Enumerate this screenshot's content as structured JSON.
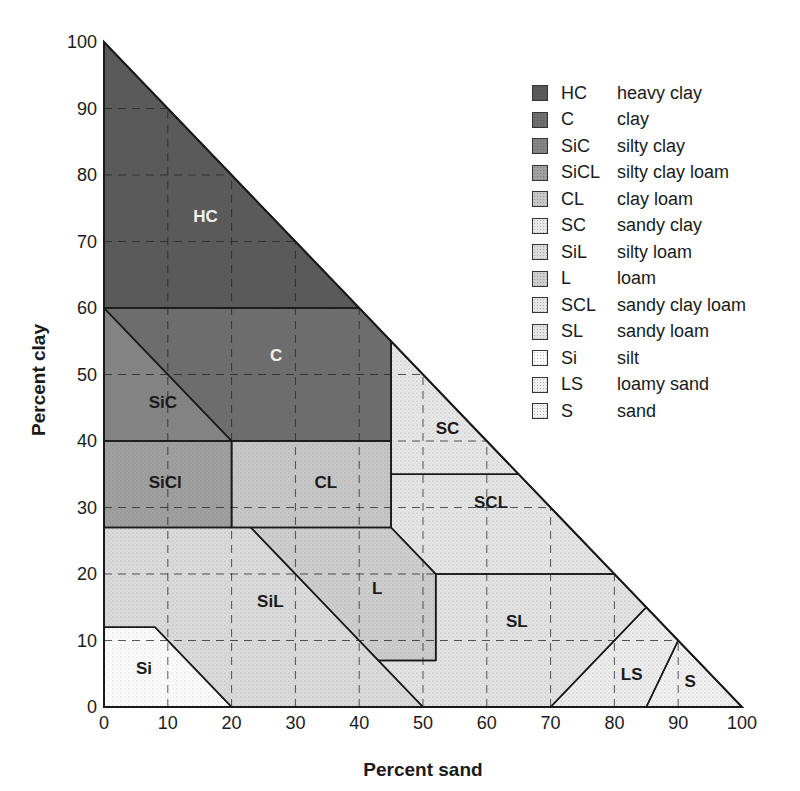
{
  "chart_data": {
    "type": "ternary-soil-texture",
    "title": "",
    "xlabel": "Percent sand",
    "ylabel": "Percent clay",
    "xlim": [
      0,
      100
    ],
    "ylim": [
      0,
      100
    ],
    "x_ticks": [
      "0",
      "10",
      "20",
      "30",
      "40",
      "50",
      "60",
      "70",
      "80",
      "90",
      "100"
    ],
    "y_ticks": [
      "0",
      "10",
      "20",
      "30",
      "40",
      "50",
      "60",
      "70",
      "80",
      "90",
      "100"
    ],
    "grid": "dashed at every 10",
    "legend_position": "upper right",
    "regions": [
      {
        "abbr": "HC",
        "name": "heavy clay",
        "label": "HC",
        "fill": "#5a5a5a",
        "polygon": [
          [
            0,
            60
          ],
          [
            0,
            100
          ],
          [
            40,
            60
          ]
        ],
        "label_at": [
          14,
          73
        ]
      },
      {
        "abbr": "C",
        "name": "clay",
        "label": "C",
        "fill": "#6e6e6e",
        "polygon": [
          [
            0,
            60
          ],
          [
            40,
            60
          ],
          [
            45,
            55
          ],
          [
            45,
            40
          ],
          [
            20,
            40
          ]
        ],
        "label_at": [
          26,
          52
        ]
      },
      {
        "abbr": "SiC",
        "name": "silty clay",
        "label": "SiC",
        "fill": "#858585",
        "polygon": [
          [
            0,
            60
          ],
          [
            20,
            40
          ],
          [
            0,
            40
          ]
        ],
        "label_at": [
          7,
          45
        ]
      },
      {
        "abbr": "SiCL",
        "name": "silty clay loam",
        "label": "SiCl",
        "fill": "#a0a0a0",
        "polygon": [
          [
            0,
            40
          ],
          [
            20,
            40
          ],
          [
            20,
            27
          ],
          [
            0,
            27
          ]
        ],
        "label_at": [
          7,
          33
        ]
      },
      {
        "abbr": "CL",
        "name": "clay loam",
        "label": "CL",
        "fill": "#c8c8c8",
        "polygon": [
          [
            20,
            40
          ],
          [
            45,
            40
          ],
          [
            45,
            27
          ],
          [
            20,
            27
          ]
        ],
        "label_at": [
          33,
          33
        ]
      },
      {
        "abbr": "SC",
        "name": "sandy clay",
        "label": "SC",
        "fill": "#e8e8e8",
        "polygon": [
          [
            45,
            55
          ],
          [
            65,
            35
          ],
          [
            45,
            35
          ]
        ],
        "label_at": [
          52,
          41
        ]
      },
      {
        "abbr": "SiL",
        "name": "silty loam",
        "label": "SiL",
        "fill": "#dcdcdc",
        "polygon": [
          [
            0,
            27
          ],
          [
            23,
            27
          ],
          [
            50,
            0
          ],
          [
            20,
            0
          ],
          [
            8,
            12
          ],
          [
            0,
            12
          ]
        ],
        "label_at": [
          24,
          15
        ]
      },
      {
        "abbr": "L",
        "name": "loam",
        "label": "L",
        "fill": "#cfcfcf",
        "polygon": [
          [
            23,
            27
          ],
          [
            45,
            27
          ],
          [
            52,
            20
          ],
          [
            52,
            7
          ],
          [
            43,
            7
          ]
        ],
        "label_at": [
          42,
          17
        ]
      },
      {
        "abbr": "SCL",
        "name": "sandy clay loam",
        "label": "SCL",
        "fill": "#e6e6e6",
        "polygon": [
          [
            45,
            35
          ],
          [
            65,
            35
          ],
          [
            80,
            20
          ],
          [
            52,
            20
          ],
          [
            45,
            27
          ]
        ],
        "label_at": [
          58,
          30
        ]
      },
      {
        "abbr": "SL",
        "name": "sandy loam",
        "label": "SL",
        "fill": "#e4e4e4",
        "polygon": [
          [
            52,
            20
          ],
          [
            80,
            20
          ],
          [
            85,
            15
          ],
          [
            70,
            0
          ],
          [
            50,
            0
          ],
          [
            43,
            7
          ],
          [
            52,
            7
          ]
        ],
        "label_at": [
          63,
          12
        ]
      },
      {
        "abbr": "Si",
        "name": "silt",
        "label": "Si",
        "fill": "#ffffff",
        "polygon": [
          [
            0,
            0
          ],
          [
            0,
            12
          ],
          [
            8,
            12
          ],
          [
            20,
            0
          ]
        ],
        "label_at": [
          5,
          5
        ]
      },
      {
        "abbr": "LS",
        "name": "loamy sand",
        "label": "LS",
        "fill": "#eeeeee",
        "polygon": [
          [
            70,
            0
          ],
          [
            85,
            15
          ],
          [
            90,
            10
          ],
          [
            85,
            0
          ]
        ],
        "label_at": [
          81,
          4
        ]
      },
      {
        "abbr": "S",
        "name": "sand",
        "label": "S",
        "fill": "#f2f2f2",
        "polygon": [
          [
            85,
            0
          ],
          [
            90,
            10
          ],
          [
            100,
            0
          ]
        ],
        "label_at": [
          91,
          3
        ]
      }
    ]
  },
  "legend": [
    {
      "abbr": "HC",
      "name": "heavy clay",
      "fill": "#5a5a5a"
    },
    {
      "abbr": "C",
      "name": "clay",
      "fill": "#6e6e6e"
    },
    {
      "abbr": "SiC",
      "name": "silty clay",
      "fill": "#858585"
    },
    {
      "abbr": "SiCL",
      "name": "silty clay loam",
      "fill": "#a0a0a0"
    },
    {
      "abbr": "CL",
      "name": "clay loam",
      "fill": "#c8c8c8"
    },
    {
      "abbr": "SC",
      "name": "sandy clay",
      "fill": "#e8e8e8"
    },
    {
      "abbr": "SiL",
      "name": "silty loam",
      "fill": "#dcdcdc"
    },
    {
      "abbr": "L",
      "name": "loam",
      "fill": "#cfcfcf"
    },
    {
      "abbr": "SCL",
      "name": "sandy clay loam",
      "fill": "#e6e6e6"
    },
    {
      "abbr": "SL",
      "name": "sandy loam",
      "fill": "#e4e4e4"
    },
    {
      "abbr": "Si",
      "name": "silt",
      "fill": "#ffffff"
    },
    {
      "abbr": "LS",
      "name": "loamy sand",
      "fill": "#eeeeee"
    },
    {
      "abbr": "S",
      "name": "sand",
      "fill": "#f2f2f2"
    }
  ]
}
